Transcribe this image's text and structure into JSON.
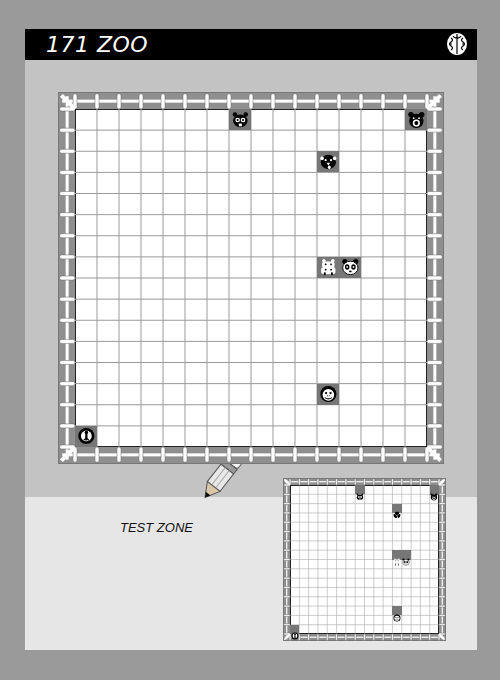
{
  "header": {
    "title": "171 ZOO",
    "icon": "brain-icon"
  },
  "puzzle": {
    "rows": 16,
    "cols": 16,
    "animals": [
      {
        "name": "beaver",
        "icon": "beaver-icon",
        "row": 0,
        "col": 7
      },
      {
        "name": "bear",
        "icon": "bear-icon",
        "row": 0,
        "col": 15
      },
      {
        "name": "dog",
        "icon": "dog-icon",
        "row": 2,
        "col": 11
      },
      {
        "name": "hippo",
        "icon": "hippo-icon",
        "row": 7,
        "col": 11
      },
      {
        "name": "panda",
        "icon": "panda-icon",
        "row": 7,
        "col": 12
      },
      {
        "name": "monkey",
        "icon": "monkey-icon",
        "row": 13,
        "col": 11
      },
      {
        "name": "ostrich",
        "icon": "ostrich-icon",
        "row": 15,
        "col": 0
      }
    ]
  },
  "test_zone": {
    "label": "TEST ZONE",
    "icon": "pencil-icon"
  }
}
